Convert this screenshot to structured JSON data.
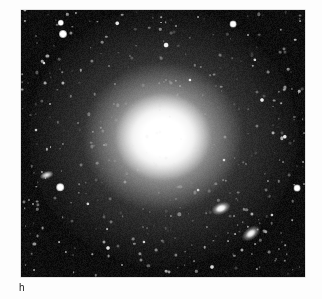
{
  "figure": {
    "label": "h",
    "caption_position": "below-left"
  },
  "image": {
    "kind": "astronomical-photograph",
    "background_color": "#050505",
    "frame": {
      "x": 21,
      "y": 10,
      "width": 284,
      "height": 267
    },
    "subject": "bright elliptical galaxy with extended diffuse halo in a dense star field",
    "objects": [
      {
        "name": "main-galaxy",
        "type": "elliptical-galaxy",
        "x": 163,
        "y": 137,
        "core_radius": 24,
        "halo_radius": 132,
        "brightness": "saturated-white-core",
        "color": "#ffffff"
      },
      {
        "name": "companion-galaxy-upper",
        "type": "companion-galaxy",
        "x": 222,
        "y": 208,
        "width": 26,
        "height": 13,
        "angle": -22,
        "color": "#ffffff"
      },
      {
        "name": "companion-galaxy-lower",
        "type": "companion-galaxy",
        "x": 253,
        "y": 232,
        "width": 32,
        "height": 13,
        "angle": -36,
        "color": "#ffffff"
      },
      {
        "name": "companion-galaxy-left",
        "type": "edge-on-galaxy",
        "x": 47,
        "y": 175,
        "width": 18,
        "height": 8,
        "angle": -18,
        "color": "#f6f6f6"
      }
    ],
    "bright_stars": [
      {
        "x": 61,
        "y": 23,
        "r": 3.2,
        "b": 1.0
      },
      {
        "x": 63,
        "y": 34,
        "r": 4.0,
        "b": 1.0
      },
      {
        "x": 233,
        "y": 24,
        "r": 3.4,
        "b": 1.0
      },
      {
        "x": 60,
        "y": 187,
        "r": 3.8,
        "b": 1.0
      },
      {
        "x": 297,
        "y": 188,
        "r": 3.4,
        "b": 1.0
      },
      {
        "x": 166,
        "y": 45,
        "r": 2.4,
        "b": 0.95
      },
      {
        "x": 117,
        "y": 23,
        "r": 1.8,
        "b": 0.9
      },
      {
        "x": 262,
        "y": 100,
        "r": 2.0,
        "b": 0.92
      },
      {
        "x": 285,
        "y": 137,
        "r": 2.2,
        "b": 0.9
      },
      {
        "x": 108,
        "y": 248,
        "r": 2.0,
        "b": 0.88
      },
      {
        "x": 212,
        "y": 267,
        "r": 2.0,
        "b": 0.85
      },
      {
        "x": 44,
        "y": 63,
        "r": 1.6,
        "b": 0.82
      },
      {
        "x": 190,
        "y": 80,
        "r": 1.6,
        "b": 0.84
      },
      {
        "x": 255,
        "y": 60,
        "r": 1.7,
        "b": 0.8
      },
      {
        "x": 88,
        "y": 204,
        "r": 1.7,
        "b": 0.8
      },
      {
        "x": 144,
        "y": 242,
        "r": 1.6,
        "b": 0.78
      },
      {
        "x": 272,
        "y": 215,
        "r": 1.6,
        "b": 0.78
      },
      {
        "x": 36,
        "y": 130,
        "r": 1.5,
        "b": 0.74
      },
      {
        "x": 224,
        "y": 160,
        "r": 1.5,
        "b": 0.74
      },
      {
        "x": 198,
        "y": 190,
        "r": 1.4,
        "b": 0.72
      }
    ],
    "field_star_count": 420,
    "faint_star_color": "#d8d8d8"
  }
}
